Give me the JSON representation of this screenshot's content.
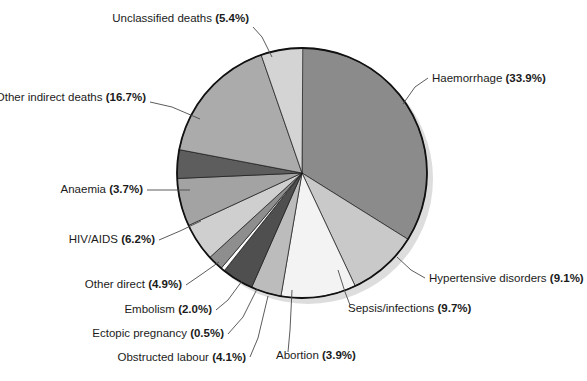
{
  "chart_data": {
    "type": "pie",
    "title": "",
    "subtitle": "",
    "xlabel": "",
    "ylabel": "",
    "legend_position": "none",
    "grid": false,
    "label_format": "{name} ({value}%)",
    "total": 100.1,
    "units": "percent",
    "categories": [
      "Haemorrhage",
      "Hypertensive disorders",
      "Sepsis/infections",
      "Abortion",
      "Obstructed labour",
      "Ectopic pregnancy",
      "Embolism",
      "Other direct",
      "HIV/AIDS",
      "Anaemia",
      "Other indirect deaths",
      "Unclassified deaths"
    ],
    "values": [
      33.9,
      9.1,
      9.7,
      3.9,
      4.1,
      0.5,
      2.0,
      4.9,
      6.2,
      3.7,
      16.7,
      5.4
    ],
    "colors": [
      "#8b8b8b",
      "#c9c9c9",
      "#f3f3f3",
      "#bcbcbc",
      "#4f4f4f",
      "#fdfdfd",
      "#8e8e8e",
      "#cfcfcf",
      "#a3a3a3",
      "#5d5d5d",
      "#ababab",
      "#d4d4d4"
    ],
    "slices": [
      {
        "name": "Haemorrhage",
        "value": 33.9,
        "label": "Haemorrhage",
        "percent": "(33.9%)",
        "color": "#8b8b8b",
        "start_angle": 0,
        "end_angle": 122.04
      },
      {
        "name": "Hypertensive disorders",
        "value": 9.1,
        "label": "Hypertensive disorders",
        "percent": "(9.1%)",
        "color": "#c9c9c9",
        "start_angle": 122.04,
        "end_angle": 154.8
      },
      {
        "name": "Sepsis/infections",
        "value": 9.7,
        "label": "Sepsis/infections",
        "percent": "(9.7%)",
        "color": "#f3f3f3",
        "start_angle": 154.8,
        "end_angle": 189.72
      },
      {
        "name": "Abortion",
        "value": 3.9,
        "label": "Abortion",
        "percent": "(3.9%)",
        "color": "#bcbcbc",
        "start_angle": 189.72,
        "end_angle": 203.76
      },
      {
        "name": "Obstructed labour",
        "value": 4.1,
        "label": "Obstructed labour",
        "percent": "(4.1%)",
        "color": "#4f4f4f",
        "start_angle": 203.76,
        "end_angle": 218.52
      },
      {
        "name": "Ectopic pregnancy",
        "value": 0.5,
        "label": "Ectopic pregnancy",
        "percent": "(0.5%)",
        "color": "#fdfdfd",
        "start_angle": 218.52,
        "end_angle": 220.32
      },
      {
        "name": "Embolism",
        "value": 2.0,
        "label": "Embolism",
        "percent": "(2.0%)",
        "color": "#8e8e8e",
        "start_angle": 220.32,
        "end_angle": 227.52
      },
      {
        "name": "Other direct",
        "value": 4.9,
        "label": "Other direct",
        "percent": "(4.9%)",
        "color": "#cfcfcf",
        "start_angle": 227.52,
        "end_angle": 245.16
      },
      {
        "name": "HIV/AIDS",
        "value": 6.2,
        "label": "HIV/AIDS",
        "percent": "(6.2%)",
        "color": "#a3a3a3",
        "start_angle": 245.16,
        "end_angle": 267.48
      },
      {
        "name": "Anaemia",
        "value": 3.7,
        "label": "Anaemia",
        "percent": "(3.7%)",
        "color": "#5d5d5d",
        "start_angle": 267.48,
        "end_angle": 280.8
      },
      {
        "name": "Other indirect deaths",
        "value": 16.7,
        "label": "Other indirect deaths",
        "percent": "(16.7%)",
        "color": "#ababab",
        "start_angle": 280.8,
        "end_angle": 340.92
      },
      {
        "name": "Unclassified deaths",
        "value": 5.4,
        "label": "Unclassified deaths",
        "percent": "(5.4%)",
        "color": "#d4d4d4",
        "start_angle": 340.92,
        "end_angle": 360.36
      }
    ],
    "annotations": [
      {
        "id": "unclassified-deaths",
        "label": "Unclassified deaths",
        "percent": "(5.4%)",
        "text_x": 249,
        "text_y": 22,
        "anchor": "end",
        "leader": "253,27 262,37 272,57"
      },
      {
        "id": "haemorrhage",
        "label": "Haemorrhage",
        "percent": "(33.9%)",
        "text_x": 432,
        "text_y": 82,
        "anchor": "start",
        "leader": "428,78 415,87 403,104"
      },
      {
        "id": "other-indirect-deaths",
        "label": "Other indirect deaths",
        "percent": "(16.7%)",
        "text_x": 146,
        "text_y": 101,
        "anchor": "end",
        "leader": "150,102 172,107 200,119"
      },
      {
        "id": "hypertensive-disorders",
        "label": "Hypertensive disorders",
        "percent": "(9.1%)",
        "text_x": 429,
        "text_y": 282,
        "anchor": "start",
        "leader": "425,278 411,270 397,257"
      },
      {
        "id": "anaemia",
        "label": "Anaemia",
        "percent": "(3.7%)",
        "text_x": 143,
        "text_y": 193,
        "anchor": "end",
        "leader": "147,190 168,190 190,190"
      },
      {
        "id": "sepsis-infections",
        "label": "Sepsis/infections",
        "percent": "(9.7%)",
        "text_x": 348,
        "text_y": 312,
        "anchor": "start",
        "leader": "350,305 345,292 338,270"
      },
      {
        "id": "hiv-aids",
        "label": "HIV/AIDS",
        "percent": "(6.2%)",
        "text_x": 155,
        "text_y": 243,
        "anchor": "end",
        "leader": "159,240 180,231 201,221"
      },
      {
        "id": "other-direct",
        "label": "Other direct",
        "percent": "(4.9%)",
        "text_x": 182,
        "text_y": 288,
        "anchor": "end",
        "leader": "186,285 202,274 219,262"
      },
      {
        "id": "abortion",
        "label": "Abortion",
        "percent": "(3.9%)",
        "text_x": 276,
        "text_y": 359,
        "anchor": "start",
        "leader": "288,352 290,330 292,290"
      },
      {
        "id": "embolism",
        "label": "Embolism",
        "percent": "(2.0%)",
        "text_x": 212,
        "text_y": 313,
        "anchor": "end",
        "leader": "216,310 228,300 242,281"
      },
      {
        "id": "ectopic-pregnancy",
        "label": "Ectopic pregnancy",
        "percent": "(0.5%)",
        "text_x": 224,
        "text_y": 337,
        "anchor": "end",
        "leader": "228,334 243,317 257,289"
      },
      {
        "id": "obstructed-labour",
        "label": "Obstructed labour",
        "percent": "(4.1%)",
        "text_x": 246,
        "text_y": 361,
        "anchor": "end",
        "leader": "250,357 258,338 268,296"
      }
    ]
  },
  "figure": {
    "background": "#ffffff",
    "center_x": 302,
    "center_y": 173,
    "radius": 125,
    "shadow_offset_x": 6,
    "shadow_offset_y": 6,
    "outline_color": "#111111"
  }
}
